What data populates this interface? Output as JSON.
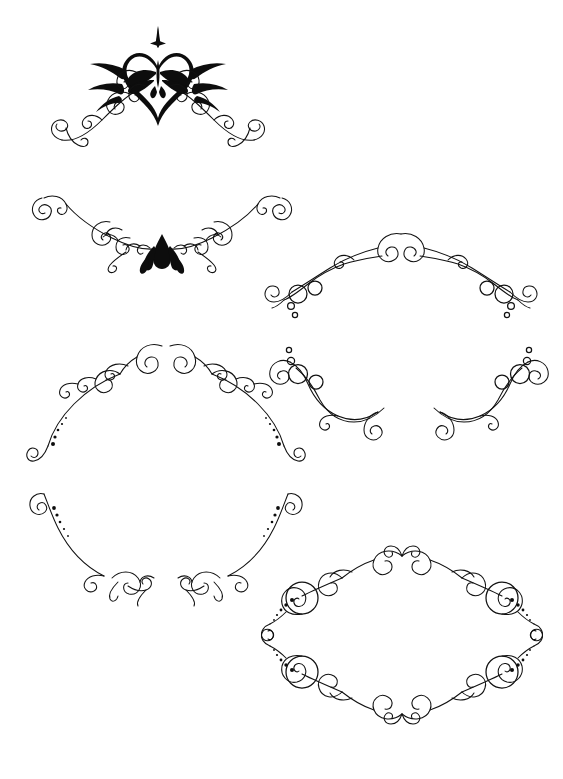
{
  "sheet": {
    "title": "Decorative Calligraphic Flourish Ornament Set",
    "width": 563,
    "height": 779,
    "background_color": "#ffffff",
    "ink_color": "#111111",
    "ornament_count": 7,
    "style": "black line-art swirl / filigree clipart, symmetric about a vertical axis"
  },
  "ornaments": [
    {
      "id": "ornament-1",
      "name": "heart-fleur-crown-flourish",
      "label": "Heart and fleur-de-lis crown flourish with sparkle",
      "position": {
        "x": 18,
        "y": 24,
        "width": 280,
        "height": 125
      },
      "symmetry": "vertical-mirror",
      "features": [
        "solid-heart",
        "fleur-de-lis",
        "four-point-sparkle",
        "feather-leaves",
        "end-spirals"
      ],
      "fill_style": "solid-black-center"
    },
    {
      "id": "ornament-2",
      "name": "swag-flame-flourish",
      "label": "Downward swag flourish with flame motif",
      "position": {
        "x": 22,
        "y": 186,
        "width": 280,
        "height": 92
      },
      "symmetry": "vertical-mirror",
      "features": [
        "swag-curve",
        "flame-lotus-center",
        "paired-scrolls",
        "end-spirals"
      ],
      "fill_style": "solid-black-center"
    },
    {
      "id": "ornament-3",
      "name": "arched-bubble-flourish",
      "label": "Arched flourish with open circle bubble clusters",
      "position": {
        "x": 258,
        "y": 222,
        "width": 286,
        "height": 98
      },
      "symmetry": "vertical-mirror",
      "features": [
        "double-arch",
        "open-circles",
        "graduated-dots",
        "end-spirals"
      ],
      "fill_style": "outline"
    },
    {
      "id": "ornament-4",
      "name": "dome-scroll-flourish",
      "label": "Domed arch flourish with dotted tails",
      "position": {
        "x": 26,
        "y": 336,
        "width": 280,
        "height": 140
      },
      "symmetry": "vertical-mirror",
      "features": [
        "dome-arch",
        "crown-spirals",
        "graduated-dots",
        "end-spirals"
      ],
      "fill_style": "outline"
    },
    {
      "id": "ornament-5",
      "name": "split-bubble-flourish",
      "label": "Split wing flourish with bubble clusters",
      "position": {
        "x": 266,
        "y": 330,
        "width": 286,
        "height": 118
      },
      "symmetry": "vertical-mirror",
      "features": [
        "s-curve-wings",
        "open-circles",
        "small-dots",
        "inner-spirals"
      ],
      "fill_style": "outline"
    },
    {
      "id": "ornament-6",
      "name": "bowl-scroll-flourish",
      "label": "Bowl shaped lower flourish with dotted tails",
      "position": {
        "x": 26,
        "y": 482,
        "width": 280,
        "height": 122
      },
      "symmetry": "vertical-mirror",
      "features": [
        "bowl-curve",
        "graduated-dots",
        "cluster-spirals",
        "end-spirals"
      ],
      "fill_style": "outline"
    },
    {
      "id": "ornament-7",
      "name": "oval-frame-flourish",
      "label": "Full oval frame of four corner spiral medallions",
      "position": {
        "x": 256,
        "y": 538,
        "width": 292,
        "height": 194
      },
      "symmetry": "four-way-mirror",
      "features": [
        "oval-frame",
        "spiral-medallion",
        "graduated-dots",
        "corner-scrolls"
      ],
      "fill_style": "outline"
    }
  ]
}
